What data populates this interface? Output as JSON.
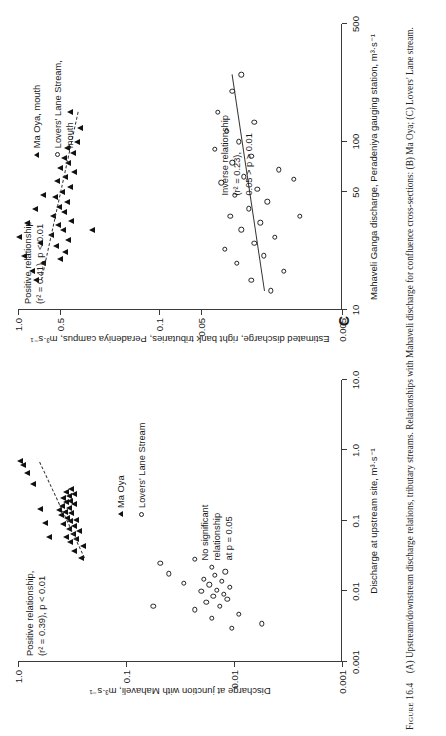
{
  "caption": {
    "figure_number": "Figure 16.4",
    "text": "(A) Upstream/downstream discharge relations, tributary streams. Relationships with Mahaveli discharge for confluence cross-sections: (B) Ma Oya; (C) Lovers' Lane stream."
  },
  "chart_data": [
    {
      "id": "A",
      "type": "scatter",
      "panel_letter": "",
      "title": "",
      "xlabel": "Discharge at upstream site, m³·s⁻¹",
      "ylabel": "Discharge at junction with Mahaveli, m³·s⁻¹",
      "xscale": "log",
      "yscale": "log",
      "xlim": [
        0.001,
        10.0
      ],
      "ylim": [
        0.001,
        1.0
      ],
      "xticks": [
        "0.001",
        "0.01",
        "0.1",
        "1.0",
        "10.0"
      ],
      "yticks": [
        "1.0",
        "0.1",
        "0.01",
        "0.001"
      ],
      "grid": false,
      "legend_position": "center-right",
      "legend": [
        {
          "marker": "filled-triangle",
          "label": "Ma Oya"
        },
        {
          "marker": "open-circle",
          "label": "Lovers' Lane Stream"
        }
      ],
      "annotations": [
        {
          "name": "positive-relationship-note",
          "text": "Positive relationship,\n(r² = 0.39), p < 0.01"
        },
        {
          "name": "no-significant-relationship-note",
          "text": "No significant\nrelationship\nat p = 0.05"
        }
      ],
      "series": [
        {
          "name": "Ma Oya",
          "marker": "filled-triangle",
          "fit": {
            "style": "dashed",
            "slope_note": "positive",
            "r2": 0.39,
            "p": "< 0.01"
          },
          "points": [
            [
              0.03,
              0.26
            ],
            [
              0.038,
              0.3
            ],
            [
              0.044,
              0.25
            ],
            [
              0.05,
              0.33
            ],
            [
              0.055,
              0.29
            ],
            [
              0.06,
              0.36
            ],
            [
              0.066,
              0.31
            ],
            [
              0.072,
              0.27
            ],
            [
              0.078,
              0.34
            ],
            [
              0.085,
              0.3
            ],
            [
              0.092,
              0.38
            ],
            [
              0.1,
              0.33
            ],
            [
              0.105,
              0.29
            ],
            [
              0.112,
              0.35
            ],
            [
              0.12,
              0.4
            ],
            [
              0.128,
              0.32
            ],
            [
              0.135,
              0.37
            ],
            [
              0.145,
              0.42
            ],
            [
              0.155,
              0.34
            ],
            [
              0.165,
              0.39
            ],
            [
              0.175,
              0.3
            ],
            [
              0.185,
              0.36
            ],
            [
              0.195,
              0.33
            ],
            [
              0.21,
              0.38
            ],
            [
              0.225,
              0.34
            ],
            [
              0.24,
              0.3
            ],
            [
              0.26,
              0.36
            ],
            [
              0.28,
              0.32
            ],
            [
              0.06,
              0.52
            ],
            [
              0.095,
              0.56
            ],
            [
              0.15,
              0.62
            ],
            [
              0.33,
              0.72
            ],
            [
              0.48,
              0.82
            ],
            [
              0.62,
              0.9
            ],
            [
              0.7,
              0.95
            ]
          ]
        },
        {
          "name": "Lovers' Lane Stream",
          "marker": "open-circle",
          "fit": null,
          "points": [
            [
              0.003,
              0.0105
            ],
            [
              0.0042,
              0.016
            ],
            [
              0.0048,
              0.009
            ],
            [
              0.0055,
              0.023
            ],
            [
              0.0062,
              0.0135
            ],
            [
              0.007,
              0.018
            ],
            [
              0.0078,
              0.0115
            ],
            [
              0.0085,
              0.0155
            ],
            [
              0.0092,
              0.0125
            ],
            [
              0.01,
              0.02
            ],
            [
              0.0105,
              0.0145
            ],
            [
              0.0115,
              0.011
            ],
            [
              0.0125,
              0.017
            ],
            [
              0.014,
              0.013
            ],
            [
              0.015,
              0.019
            ],
            [
              0.017,
              0.015
            ],
            [
              0.019,
              0.012
            ],
            [
              0.022,
              0.016
            ],
            [
              0.0035,
              0.0055
            ],
            [
              0.013,
              0.029
            ],
            [
              0.018,
              0.04
            ],
            [
              0.025,
              0.048
            ],
            [
              0.0062,
              0.056
            ],
            [
              0.029,
              0.023
            ]
          ]
        }
      ]
    },
    {
      "id": "C",
      "type": "scatter",
      "panel_letter": "C",
      "title": "",
      "xlabel": "Mahaveli Ganga discharge, Peradeniya gauging station, m³·s⁻¹",
      "ylabel": "Estimated discharge, right bank tributaries, Peradeniya campus, m³·s⁻¹",
      "xscale": "log",
      "yscale": "log",
      "xlim": [
        10,
        500
      ],
      "ylim": [
        0.005,
        1.0
      ],
      "xticks": [
        "10",
        "50",
        "100",
        "500"
      ],
      "yticks": [
        "1.0",
        "0.5",
        "0.1",
        "0.05",
        "0.005",
        "0.001"
      ],
      "grid": false,
      "legend_position": "upper-right",
      "legend": [
        {
          "marker": "filled-triangle",
          "label": "Ma Oya, mouth"
        },
        {
          "marker": "open-circle",
          "label": "Lovers' Lane Stream,\nmouth"
        }
      ],
      "annotations": [
        {
          "name": "positive-relationship-note",
          "text": "Positive relationship\n(r² = 0.41), p < 0.01"
        },
        {
          "name": "inverse-relationship-note",
          "text": "Inverse relationship\n(r² = 0.23),\n0.05 > p > 0.01"
        }
      ],
      "series": [
        {
          "name": "Ma Oya, mouth",
          "marker": "filled-triangle",
          "fit": {
            "style": "dashed",
            "slope_note": "positive",
            "r2": 0.41,
            "p": "< 0.01"
          },
          "points": [
            [
              20,
              0.5
            ],
            [
              22,
              0.46
            ],
            [
              24,
              0.54
            ],
            [
              26,
              0.44
            ],
            [
              28,
              0.58
            ],
            [
              30,
              0.48
            ],
            [
              32,
              0.52
            ],
            [
              34,
              0.42
            ],
            [
              36,
              0.56
            ],
            [
              38,
              0.47
            ],
            [
              41,
              0.51
            ],
            [
              44,
              0.45
            ],
            [
              47,
              0.55
            ],
            [
              50,
              0.49
            ],
            [
              54,
              0.43
            ],
            [
              58,
              0.53
            ],
            [
              62,
              0.46
            ],
            [
              66,
              0.4
            ],
            [
              70,
              0.5
            ],
            [
              75,
              0.44
            ],
            [
              80,
              0.47
            ],
            [
              86,
              0.41
            ],
            [
              92,
              0.45
            ],
            [
              100,
              0.38
            ],
            [
              15,
              0.74
            ],
            [
              17,
              0.8
            ],
            [
              19,
              0.66
            ],
            [
              21,
              0.9
            ],
            [
              25,
              0.7
            ],
            [
              27,
              0.98
            ],
            [
              33,
              0.86
            ],
            [
              40,
              0.76
            ],
            [
              48,
              0.66
            ],
            [
              30,
              0.3
            ],
            [
              120,
              0.36
            ],
            [
              150,
              0.43
            ]
          ]
        },
        {
          "name": "Lovers' Lane Stream, mouth",
          "marker": "open-circle",
          "fit": {
            "style": "solid",
            "slope_note": "inverse",
            "r2": 0.23,
            "p": "0.05 > p > 0.01"
          },
          "points": [
            [
              13,
              0.016
            ],
            [
              15,
              0.022
            ],
            [
              17,
              0.013
            ],
            [
              19,
              0.028
            ],
            [
              21,
              0.018
            ],
            [
              23,
              0.034
            ],
            [
              25,
              0.021
            ],
            [
              27,
              0.015
            ],
            [
              30,
              0.026
            ],
            [
              33,
              0.019
            ],
            [
              36,
              0.031
            ],
            [
              40,
              0.023
            ],
            [
              44,
              0.017
            ],
            [
              48,
              0.029
            ],
            [
              52,
              0.02
            ],
            [
              57,
              0.036
            ],
            [
              62,
              0.025
            ],
            [
              68,
              0.014
            ],
            [
              75,
              0.03
            ],
            [
              82,
              0.022
            ],
            [
              90,
              0.04
            ],
            [
              100,
              0.027
            ],
            [
              115,
              0.033
            ],
            [
              130,
              0.021
            ],
            [
              150,
              0.038
            ],
            [
              200,
              0.03
            ],
            [
              250,
              0.026
            ],
            [
              60,
              0.011
            ],
            [
              36,
              0.01
            ]
          ]
        }
      ]
    }
  ]
}
